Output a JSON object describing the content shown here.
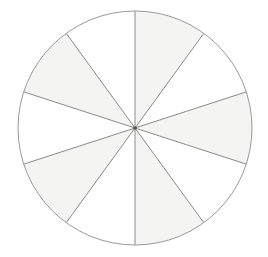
{
  "figure": {
    "name": "fraction-circle",
    "background_color": "#ffffff"
  },
  "chart_data": {
    "type": "pie",
    "title": "",
    "subtitle": "",
    "xlabel": "",
    "ylabel": "",
    "legend": [],
    "grid": false,
    "slice_count": 10,
    "slice_angle_degrees": 36,
    "start_angle_degrees": 90,
    "direction": "counterclockwise",
    "categories": [
      "sector-1",
      "sector-2",
      "sector-3",
      "sector-4",
      "sector-5",
      "sector-6",
      "sector-7",
      "sector-8",
      "sector-9",
      "sector-10"
    ],
    "values": [
      10,
      10,
      10,
      10,
      10,
      10,
      10,
      10,
      10,
      10
    ],
    "shaded_count": 5,
    "unshaded_count": 5,
    "fraction_shaded": "5/10",
    "slices": [
      {
        "index": 1,
        "start_deg": 90,
        "end_deg": 126,
        "shaded": false,
        "fill": "#ffffff"
      },
      {
        "index": 2,
        "start_deg": 126,
        "end_deg": 162,
        "shaded": true,
        "fill": "#f4f4f2"
      },
      {
        "index": 3,
        "start_deg": 162,
        "end_deg": 198,
        "shaded": false,
        "fill": "#ffffff"
      },
      {
        "index": 4,
        "start_deg": 198,
        "end_deg": 234,
        "shaded": true,
        "fill": "#f4f4f2"
      },
      {
        "index": 5,
        "start_deg": 234,
        "end_deg": 270,
        "shaded": false,
        "fill": "#ffffff"
      },
      {
        "index": 6,
        "start_deg": 270,
        "end_deg": 306,
        "shaded": true,
        "fill": "#f4f4f2"
      },
      {
        "index": 7,
        "start_deg": 306,
        "end_deg": 342,
        "shaded": false,
        "fill": "#ffffff"
      },
      {
        "index": 8,
        "start_deg": 342,
        "end_deg": 18,
        "shaded": true,
        "fill": "#f4f4f2"
      },
      {
        "index": 9,
        "start_deg": 18,
        "end_deg": 54,
        "shaded": false,
        "fill": "#ffffff"
      },
      {
        "index": 10,
        "start_deg": 54,
        "end_deg": 90,
        "shaded": true,
        "fill": "#f4f4f2"
      }
    ]
  },
  "geometry": {
    "center_x": 135,
    "center_y": 128,
    "radius": 117,
    "outline_color": "#9a9a9a",
    "outline_width": 1,
    "spoke_color": "#8a8a8a",
    "spoke_width": 1,
    "shaded_fill": "#f4f4f2",
    "unshaded_fill": "#ffffff",
    "center_dot_color": "#555555"
  }
}
